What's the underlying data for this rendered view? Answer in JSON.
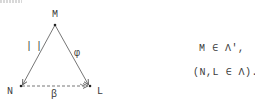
{
  "diagram": {
    "vertices": {
      "top": {
        "label": "M"
      },
      "left": {
        "label": "N"
      },
      "right": {
        "label": "L"
      }
    },
    "edges": {
      "top_to_left": {
        "label": "| |",
        "style": "solid-arrow"
      },
      "top_to_right": {
        "label": "φ",
        "style": "solid-arrow"
      },
      "left_to_right": {
        "label": "β",
        "style": "dashed-arrow"
      }
    },
    "line_color": "#555555"
  },
  "relations": {
    "line1": "M ∈ Λ',",
    "line2": "(N,L ∈ Λ)."
  }
}
